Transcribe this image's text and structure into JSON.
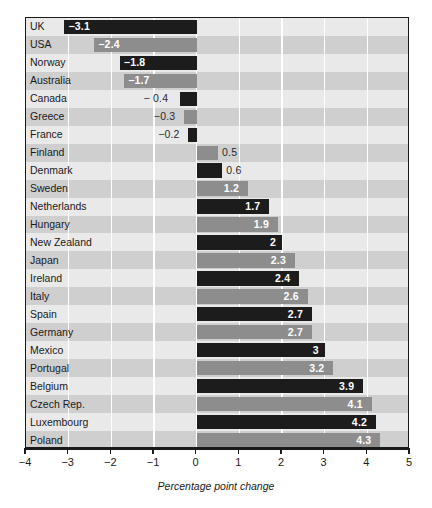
{
  "chart_data": {
    "type": "bar",
    "orientation": "horizontal",
    "title": "",
    "subtitle": "",
    "xlabel": "Percentage point change",
    "ylabel": "",
    "xlim": [
      -4,
      5
    ],
    "xticks": [
      -4,
      -3,
      -2,
      -1,
      0,
      1,
      2,
      3,
      4,
      5
    ],
    "xticklabels": [
      "−4",
      "−3",
      "−2",
      "−1",
      "0",
      "1",
      "2",
      "3",
      "4",
      "5"
    ],
    "grid": "vertical-white-gridlines",
    "legend": "none",
    "categories": [
      "UK",
      "USA",
      "Norway",
      "Australia",
      "Canada",
      "Greece",
      "France",
      "Finland",
      "Denmark",
      "Sweden",
      "Netherlands",
      "Hungary",
      "New Zealand",
      "Japan",
      "Ireland",
      "Italy",
      "Spain",
      "Germany",
      "Mexico",
      "Portugal",
      "Belgium",
      "Czech Rep.",
      "Luxembourg",
      "Poland"
    ],
    "values": [
      -3.1,
      -2.4,
      -1.8,
      -1.7,
      -0.4,
      -0.3,
      -0.2,
      0.5,
      0.6,
      1.2,
      1.7,
      1.9,
      2,
      2.3,
      2.4,
      2.6,
      2.7,
      2.7,
      3,
      3.2,
      3.9,
      4.1,
      4.2,
      4.3
    ],
    "value_labels": [
      "−3.1",
      "−2.4",
      "−1.8",
      "−1.7",
      "− 0.4",
      "−0.3",
      "−0.2",
      "0.5",
      "0.6",
      "1.2",
      "1.7",
      "1.9",
      "2",
      "2.3",
      "2.4",
      "2.6",
      "2.7",
      "2.7",
      "3",
      "3.2",
      "3.9",
      "4.1",
      "4.2",
      "4.3"
    ],
    "bar_colors": [
      "#1c1c1c",
      "#8d8d8d",
      "#1c1c1c",
      "#8d8d8d",
      "#1c1c1c",
      "#8d8d8d",
      "#1c1c1c",
      "#8d8d8d",
      "#1c1c1c",
      "#8d8d8d",
      "#1c1c1c",
      "#8d8d8d",
      "#1c1c1c",
      "#8d8d8d",
      "#1c1c1c",
      "#8d8d8d",
      "#1c1c1c",
      "#8d8d8d",
      "#1c1c1c",
      "#8d8d8d",
      "#1c1c1c",
      "#8d8d8d",
      "#1c1c1c",
      "#8d8d8d"
    ],
    "row_band_colors": [
      "#e9e9e9",
      "#cfcfcf"
    ],
    "colors": {
      "bar_dark": "#1c1c1c",
      "bar_gray": "#8d8d8d",
      "band_light": "#e9e9e9",
      "band_dark": "#cfcfcf",
      "gridline": "#ffffff",
      "axis": "#1a1a1a",
      "label_on_bar": "#ffffff",
      "label_off_bar": "#2a2a2a"
    }
  }
}
